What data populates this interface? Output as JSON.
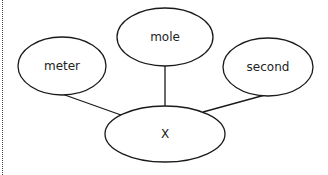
{
  "diagram": {
    "type": "concept-map",
    "center_node": {
      "id": "x",
      "label": "X",
      "cx": 165,
      "cy": 134,
      "rx": 60,
      "ry": 28
    },
    "nodes": [
      {
        "id": "meter",
        "label": "meter",
        "cx": 62,
        "cy": 66,
        "rx": 44,
        "ry": 29
      },
      {
        "id": "mole",
        "label": "mole",
        "cx": 165,
        "cy": 37,
        "rx": 48,
        "ry": 29
      },
      {
        "id": "second",
        "label": "second",
        "cx": 268,
        "cy": 67,
        "rx": 45,
        "ry": 29
      }
    ],
    "edges": [
      {
        "from": "meter",
        "to": "x"
      },
      {
        "from": "mole",
        "to": "x"
      },
      {
        "from": "second",
        "to": "x"
      }
    ],
    "stroke_color": "#1a1a1a"
  }
}
